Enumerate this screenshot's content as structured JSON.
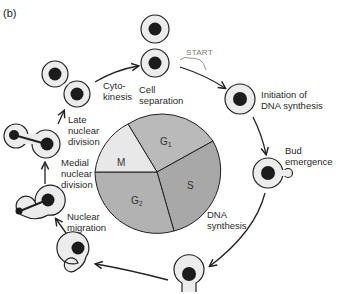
{
  "panel_label": "(b)",
  "start_label": "START",
  "phases": {
    "G1": {
      "main": "G",
      "sub": "1"
    },
    "S": {
      "main": "S",
      "sub": ""
    },
    "G2": {
      "main": "G",
      "sub": "2"
    },
    "M": {
      "main": "M",
      "sub": ""
    }
  },
  "stages": [
    {
      "id": "cell-separation",
      "label": "Cell\nseparation"
    },
    {
      "id": "initiation-dna-synthesis",
      "label": "Initiation of\nDNA synthesis"
    },
    {
      "id": "bud-emergence",
      "label": "Bud\nemergence"
    },
    {
      "id": "dna-synthesis",
      "label": "DNA\nsynthesis"
    },
    {
      "id": "nuclear-migration",
      "label": "Nuclear\nmigration"
    },
    {
      "id": "medial-nuclear-division",
      "label": "Medial\nnuclear\ndivision"
    },
    {
      "id": "late-nuclear-division",
      "label": "Late\nnuclear\ndivision"
    },
    {
      "id": "cytokinesis",
      "label": "Cyto-\nkinesis"
    }
  ],
  "colors": {
    "pie_g1": "#b9b9b9",
    "pie_s": "#a9a9a9",
    "pie_g2": "#b0b0b0",
    "pie_m": "#e9e9e9",
    "cell_fill": "#ececec",
    "nucleus": "#1c1c1c",
    "stroke": "#222222"
  }
}
